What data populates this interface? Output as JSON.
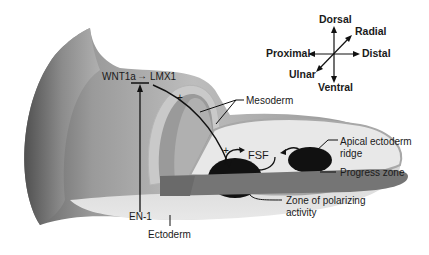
{
  "figure": {
    "orientation": {
      "dorsal": "Dorsal",
      "ventral": "Ventral",
      "proximal": "Proximal",
      "distal": "Distal",
      "radial": "Radial",
      "ulnar": "Ulnar"
    },
    "labels": {
      "wnt": "WNT1a",
      "lmx": "LMX1",
      "en1": "EN-1",
      "mesoderm": "Mesoderm",
      "ectoderm": "Ectoderm",
      "fsf": "FSF",
      "aer_line1": "Apical ectoderm",
      "aer_line2": "ridge",
      "progress_zone": "Progress zone",
      "zpa_line1": "Zone of polarizing",
      "zpa_line2": "activity",
      "plus1": "+",
      "plus2": "+"
    },
    "colors": {
      "limb_dark": "#6e6e6e",
      "limb_mid": "#a5a5a5",
      "limb_light": "#cfcfcf",
      "mesoderm_fill": "#e6e6e6",
      "band": "#7a7a7a",
      "zone": "#111111",
      "ink": "#1a1a1a"
    }
  }
}
